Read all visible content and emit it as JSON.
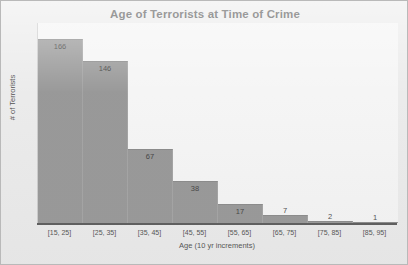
{
  "chart_data": {
    "type": "bar",
    "title": "Age of Terrorists at Time of Crime",
    "xlabel": "Age (10 yr increments)",
    "ylabel": "# of Terrorists",
    "categories": [
      "[15, 25]",
      "[25, 35]",
      "[35, 45]",
      "[45, 55]",
      "[55, 65]",
      "[65, 75]",
      "[75, 85]",
      "[85, 95]"
    ],
    "values": [
      166,
      146,
      67,
      38,
      17,
      7,
      2,
      1
    ],
    "ylim": [
      0,
      180
    ],
    "grid": false,
    "legend": null,
    "bar_color": "#8d8d8d",
    "plot_background": "#f4f4f4",
    "frame_background": "#e9e9e9",
    "axis_color": "#4a4a4a",
    "title_color": "#3a3a3a"
  }
}
